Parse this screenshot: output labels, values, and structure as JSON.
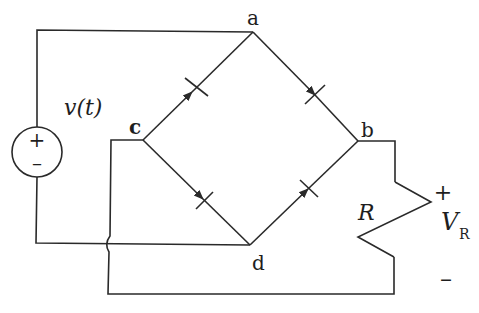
{
  "diagram": {
    "type": "full-wave bridge rectifier circuit",
    "source": {
      "label": "v(t)",
      "plus": "+",
      "minus": "–"
    },
    "nodes": {
      "a": "a",
      "b": "b",
      "c": "c",
      "d": "d"
    },
    "diodes": [
      {
        "from": "c",
        "to": "a"
      },
      {
        "from": "a",
        "to": "b"
      },
      {
        "from": "c",
        "to": "d"
      },
      {
        "from": "d",
        "to": "b"
      }
    ],
    "load": {
      "resistor_label": "R",
      "voltage_label": "V",
      "voltage_subscript": "R",
      "plus": "+",
      "minus": "–"
    },
    "colors": {
      "line": "#2a2a2a",
      "background": "#ffffff"
    }
  }
}
